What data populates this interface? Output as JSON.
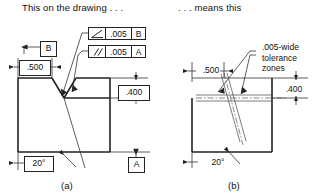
{
  "figure": {
    "title_left": "This on the drawing . . .",
    "title_right": ". . . means this",
    "label_a": "(a)",
    "label_b": "(b)"
  },
  "drawing_a": {
    "datum_b_label": "B",
    "datum_a_label": "A",
    "dim_width": ".500",
    "dim_height": ".400",
    "angle": "20°",
    "feature_control_frames": [
      {
        "name": "angularity-frame",
        "symbol": "angularity-icon",
        "symbol_glyph": "∠",
        "tolerance": ".005",
        "datum": "B"
      },
      {
        "name": "parallelism-frame",
        "symbol": "parallelism-icon",
        "symbol_glyph": "//",
        "tolerance": ".005",
        "datum": "A"
      }
    ]
  },
  "drawing_b": {
    "dim_width": ".500",
    "dim_height": ".400",
    "angle": "20°",
    "note": ".005-wide\ntolerance\nzones"
  },
  "colors": {
    "outline": "#222222",
    "thin_line": "#333333",
    "background": "#ffffff",
    "text": "#111111"
  }
}
